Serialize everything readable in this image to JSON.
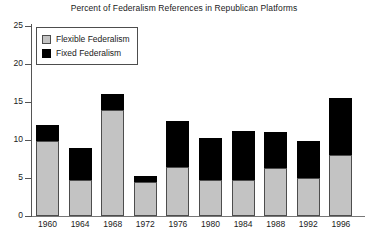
{
  "chart_data": {
    "type": "bar",
    "subtype": "stacked-vertical",
    "title": "Percent of Federalism References in Republican Platforms",
    "xlabel": "",
    "ylabel": "",
    "ylim": [
      0,
      25
    ],
    "yticks": [
      0,
      5,
      10,
      15,
      20,
      25
    ],
    "grid": false,
    "legend_position": "top-left",
    "categories": [
      "1960",
      "1964",
      "1968",
      "1972",
      "1976",
      "1980",
      "1984",
      "1988",
      "1992",
      "1996"
    ],
    "series": [
      {
        "name": "Flexible Federalism",
        "color": "#c3c3c3",
        "values": [
          9.9,
          4.8,
          13.9,
          4.5,
          6.5,
          4.7,
          4.7,
          6.3,
          5.0,
          8.0
        ]
      },
      {
        "name": "Fixed Federalism",
        "color": "#000000",
        "values": [
          2.1,
          4.2,
          2.1,
          0.7,
          6.0,
          5.5,
          6.5,
          4.7,
          4.9,
          7.5
        ]
      }
    ],
    "totals": [
      12.0,
      9.0,
      16.0,
      5.2,
      12.5,
      10.2,
      11.2,
      11.0,
      9.9,
      15.5
    ]
  },
  "legend": {
    "items": [
      {
        "label": "Flexible Federalism",
        "swatch": "flexible-swatch"
      },
      {
        "label": "Fixed Federalism",
        "swatch": "fixed-swatch"
      }
    ]
  }
}
